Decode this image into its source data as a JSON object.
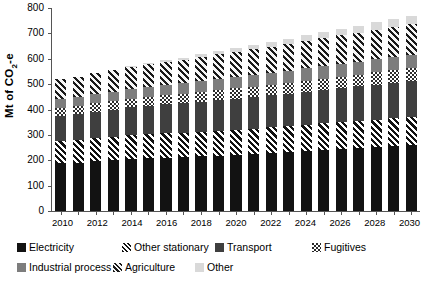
{
  "chart_data": {
    "type": "bar",
    "stacked": true,
    "title": "",
    "xlabel": "",
    "ylabel": "Mt of CO2-e",
    "ylabel_rich": {
      "prefix": "Mt of CO",
      "sub": "2",
      "suffix": "-e"
    },
    "ylim": [
      0,
      800
    ],
    "yticks": [
      0,
      100,
      200,
      300,
      400,
      500,
      600,
      700,
      800
    ],
    "grid": false,
    "legend_position": "bottom",
    "categories": [
      "2010",
      "2011",
      "2012",
      "2013",
      "2014",
      "2015",
      "2016",
      "2017",
      "2018",
      "2019",
      "2020",
      "2021",
      "2022",
      "2023",
      "2024",
      "2025",
      "2026",
      "2027",
      "2028",
      "2029",
      "2030"
    ],
    "tick_labels_shown": [
      "2010",
      "2012",
      "2014",
      "2016",
      "2018",
      "2020",
      "2022",
      "2024",
      "2026",
      "2028",
      "2030"
    ],
    "series": [
      {
        "name": "Electricity",
        "color": "#121212",
        "pattern": "solid",
        "values": [
          188,
          190,
          196,
          200,
          205,
          207,
          210,
          212,
          215,
          218,
          221,
          224,
          228,
          232,
          236,
          240,
          244,
          248,
          252,
          256,
          260
        ]
      },
      {
        "name": "Other stationary",
        "color": "#111111",
        "pattern": "diagonal-stripe",
        "values": [
          86,
          88,
          90,
          92,
          94,
          95,
          96,
          97,
          98,
          99,
          100,
          101,
          102,
          103,
          104,
          105,
          106,
          107,
          108,
          109,
          110
        ]
      },
      {
        "name": "Transport",
        "color": "#3f3f3f",
        "pattern": "solid",
        "values": [
          102,
          104,
          106,
          108,
          110,
          112,
          114,
          116,
          118,
          120,
          122,
          124,
          126,
          128,
          130,
          132,
          134,
          136,
          138,
          140,
          142
        ]
      },
      {
        "name": "Fugitives",
        "color": "#2b2b2b",
        "pattern": "checkerboard",
        "values": [
          30,
          31,
          32,
          33,
          34,
          35,
          36,
          37,
          38,
          39,
          40,
          41,
          42,
          43,
          44,
          45,
          46,
          47,
          48,
          49,
          50
        ]
      },
      {
        "name": "Industrial process",
        "color": "#7d7d7d",
        "pattern": "solid",
        "values": [
          34,
          35,
          36,
          37,
          38,
          39,
          40,
          41,
          42,
          43,
          44,
          45,
          46,
          47,
          48,
          49,
          50,
          51,
          52,
          53,
          54
        ]
      },
      {
        "name": "Agriculture",
        "color": "#1a1a1a",
        "pattern": "diagonal-stripe-dark",
        "values": [
          80,
          82,
          84,
          86,
          88,
          90,
          92,
          94,
          96,
          98,
          100,
          102,
          104,
          106,
          108,
          110,
          112,
          114,
          116,
          118,
          120
        ]
      },
      {
        "name": "Other",
        "color": "#d9d9d9",
        "pattern": "solid",
        "values": [
          0,
          0,
          0,
          0,
          2,
          4,
          6,
          8,
          10,
          12,
          14,
          16,
          18,
          20,
          22,
          24,
          26,
          28,
          30,
          32,
          34
        ]
      }
    ],
    "totals": [
      520,
      530,
      544,
      556,
      571,
      582,
      594,
      605,
      617,
      629,
      641,
      653,
      666,
      679,
      692,
      705,
      718,
      731,
      744,
      757,
      770
    ]
  },
  "legend": {
    "items": [
      {
        "label": "Electricity",
        "key": "electricity"
      },
      {
        "label": "Other stationary",
        "key": "otherstationary"
      },
      {
        "label": "Transport",
        "key": "transport"
      },
      {
        "label": "Fugitives",
        "key": "fugitives"
      },
      {
        "label": "Industrial process",
        "key": "industrial"
      },
      {
        "label": "Agriculture",
        "key": "agriculture"
      },
      {
        "label": "Other",
        "key": "other"
      }
    ]
  }
}
